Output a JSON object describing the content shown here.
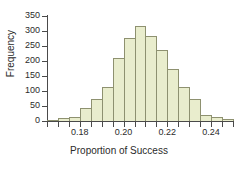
{
  "chart_data": {
    "type": "bar",
    "title": "",
    "xlabel": "Proportion of Success",
    "ylabel": "Frequency",
    "categories": [
      "0.1675",
      "0.1725",
      "0.1775",
      "0.1825",
      "0.1875",
      "0.1925",
      "0.1975",
      "0.2025",
      "0.2075",
      "0.2125",
      "0.2175",
      "0.2225",
      "0.2275",
      "0.2325",
      "0.2375",
      "0.2425",
      "0.2475"
    ],
    "values": [
      4,
      10,
      15,
      42,
      75,
      114,
      211,
      276,
      318,
      282,
      238,
      174,
      114,
      73,
      19,
      13,
      6
    ],
    "bin_width": 0.005,
    "bin_edges": [
      0.165,
      0.17,
      0.175,
      0.18,
      0.185,
      0.19,
      0.195,
      0.2,
      0.205,
      0.21,
      0.215,
      0.22,
      0.225,
      0.23,
      0.235,
      0.24,
      0.245,
      0.25
    ],
    "xlim": [
      0.165,
      0.25
    ],
    "ylim": [
      0,
      350
    ],
    "grid": false,
    "legend": false,
    "bar_fill_color": "#e9edcd",
    "bar_border_color": "#8e9170",
    "axis_color": "#4a4a4a",
    "yticks": [
      0,
      50,
      100,
      150,
      200,
      250,
      300,
      350
    ],
    "ytick_labels": [
      "0",
      "50",
      "100",
      "150",
      "200",
      "250",
      "300",
      "350"
    ],
    "xticks": [
      0.18,
      0.2,
      0.22,
      0.24
    ],
    "xtick_labels": [
      "0.18",
      "0.20",
      "0.22",
      "0.24"
    ]
  }
}
